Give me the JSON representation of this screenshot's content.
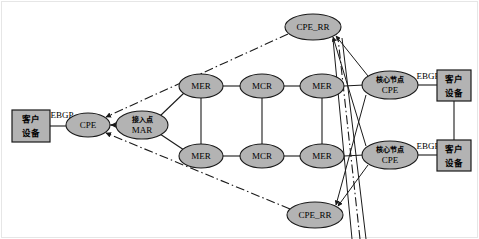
{
  "diagram": {
    "canvas": {
      "width": 479,
      "height": 239
    },
    "colors": {
      "node_fill": "#b3b3b3",
      "node_stroke": "#1a1a1a",
      "edge": "#1a1a1a",
      "frame": "#e6e6e6",
      "background": "#ffffff"
    },
    "nodes": {
      "cust_left": {
        "line1": "客户",
        "line2": "设备",
        "shape": "rect",
        "x": 12,
        "y": 110,
        "w": 38,
        "h": 32
      },
      "cpe_left": {
        "label": "CPE",
        "shape": "ellipse",
        "cx": 88,
        "cy": 125,
        "rx": 22,
        "ry": 12
      },
      "mar": {
        "line1": "接入点",
        "line2": "MAR",
        "shape": "ellipse",
        "cx": 142,
        "cy": 125,
        "rx": 26,
        "ry": 14
      },
      "mer_tl": {
        "label": "MER",
        "shape": "ellipse",
        "cx": 201,
        "cy": 86,
        "rx": 22,
        "ry": 12
      },
      "mcr_t": {
        "label": "MCR",
        "shape": "ellipse",
        "cx": 262,
        "cy": 86,
        "rx": 22,
        "ry": 12
      },
      "mer_tr": {
        "label": "MER",
        "shape": "ellipse",
        "cx": 322,
        "cy": 86,
        "rx": 22,
        "ry": 12
      },
      "mer_bl": {
        "label": "MER",
        "shape": "ellipse",
        "cx": 201,
        "cy": 156,
        "rx": 22,
        "ry": 12
      },
      "mcr_b": {
        "label": "MCR",
        "shape": "ellipse",
        "cx": 262,
        "cy": 156,
        "rx": 22,
        "ry": 12
      },
      "mer_br": {
        "label": "MER",
        "shape": "ellipse",
        "cx": 322,
        "cy": 156,
        "rx": 22,
        "ry": 12
      },
      "cpe_rr_top": {
        "label": "CPE_RR",
        "shape": "ellipse",
        "cx": 313,
        "cy": 27,
        "rx": 28,
        "ry": 13
      },
      "cpe_rr_bottom": {
        "label": "CPE_RR",
        "shape": "ellipse",
        "cx": 315,
        "cy": 215,
        "rx": 28,
        "ry": 13
      },
      "core_cpe_top": {
        "line1": "核心节点",
        "line2": "CPE",
        "shape": "ellipse",
        "cx": 390,
        "cy": 85,
        "rx": 28,
        "ry": 14
      },
      "core_cpe_bottom": {
        "line1": "核心节点",
        "line2": "CPE",
        "shape": "ellipse",
        "cx": 390,
        "cy": 155,
        "rx": 28,
        "ry": 14
      },
      "cust_right_top": {
        "line1": "客户",
        "line2": "设备",
        "shape": "rect",
        "x": 437,
        "y": 70,
        "w": 34,
        "h": 31
      },
      "cust_right_bottom": {
        "line1": "客户",
        "line2": "设备",
        "shape": "rect",
        "x": 437,
        "y": 140,
        "w": 34,
        "h": 31
      }
    },
    "link_labels": {
      "ebgp_left": "EBGP",
      "ebgp_right_top": "EBGP",
      "ebgp_right_bottom": "EBGP"
    },
    "legend_note": ""
  }
}
